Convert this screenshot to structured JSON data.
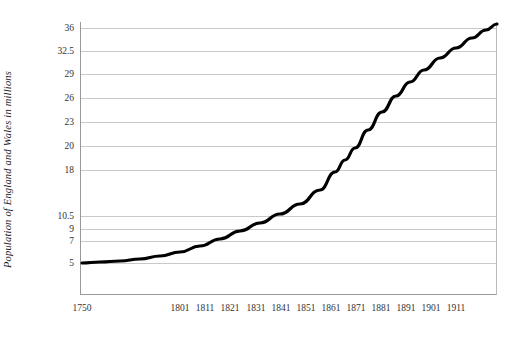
{
  "chart_data": {
    "type": "line",
    "title": "",
    "xlabel": "",
    "ylabel": "Population of England and Wales in millions",
    "grid": true,
    "legend": "none",
    "line_color": "#000000",
    "grid_color": "#c9c9c9",
    "axis_color": "#9a9a9a",
    "background": "#ffffff",
    "x_tick_labels": [
      "1750",
      "1801",
      "1811",
      "1821",
      "1831",
      "1841",
      "1851",
      "1861",
      "1871",
      "1881",
      "1891",
      "1901",
      "1911"
    ],
    "y_tick_labels": [
      "36",
      "32.5",
      "29",
      "26",
      "23",
      "20",
      "18",
      "10.5",
      "9",
      "7",
      "5"
    ],
    "y_tick_values": [
      36,
      32.5,
      29,
      26,
      23,
      20,
      18,
      10.5,
      9,
      7,
      5
    ],
    "y_tick_pixel_positions": [
      28,
      51,
      74,
      98,
      122,
      146,
      170,
      216,
      229,
      241,
      263
    ],
    "x_tick_pixel_positions": [
      82,
      180,
      205,
      230,
      256,
      281,
      306,
      331,
      356,
      381,
      406,
      431,
      456
    ],
    "xlim": [
      1750,
      1921
    ],
    "ylim": [
      5,
      36
    ],
    "x": [
      1750,
      1801,
      1811,
      1821,
      1831,
      1841,
      1851,
      1861,
      1871,
      1881,
      1891,
      1901,
      1911,
      1921
    ],
    "values": [
      5.0,
      6.0,
      6.6,
      7.5,
      8.6,
      9.8,
      11.2,
      12.8,
      14.8,
      17.1,
      20.5,
      24.7,
      29.0,
      32.5
    ],
    "series": [
      {
        "name": "Population of England and Wales",
        "values": [
          5.0,
          6.0,
          6.6,
          7.5,
          8.6,
          9.8,
          11.2,
          12.8,
          14.8,
          17.1,
          20.5,
          24.7,
          29.0,
          32.5
        ]
      }
    ],
    "curve_pixel_points": [
      [
        82,
        263
      ],
      [
        100,
        262
      ],
      [
        120,
        261
      ],
      [
        140,
        259
      ],
      [
        160,
        256
      ],
      [
        180,
        252
      ],
      [
        200,
        246
      ],
      [
        220,
        239
      ],
      [
        240,
        231
      ],
      [
        260,
        223
      ],
      [
        280,
        214
      ],
      [
        300,
        204
      ],
      [
        320,
        190
      ],
      [
        335,
        172
      ],
      [
        345,
        160
      ],
      [
        355,
        148
      ],
      [
        368,
        130
      ],
      [
        382,
        112
      ],
      [
        396,
        96
      ],
      [
        410,
        82
      ],
      [
        424,
        70
      ],
      [
        440,
        58
      ],
      [
        456,
        48
      ],
      [
        472,
        38
      ],
      [
        486,
        30
      ],
      [
        497,
        24
      ]
    ]
  }
}
